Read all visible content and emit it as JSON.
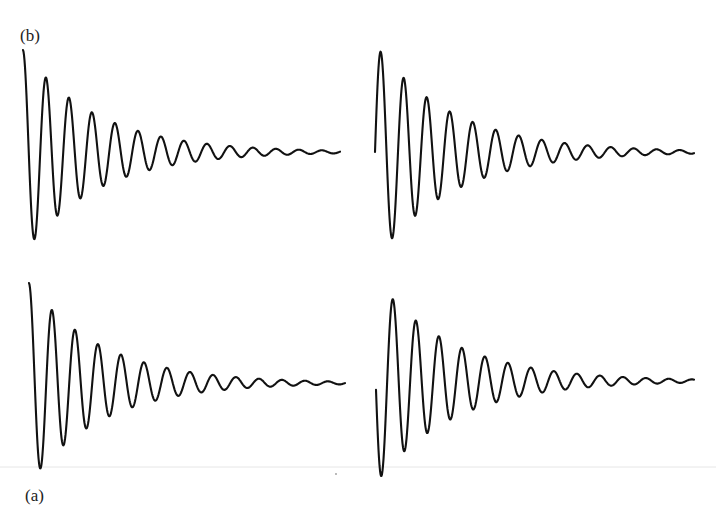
{
  "figure": {
    "labels": [
      {
        "id": "b",
        "text": "(b)",
        "x": 20,
        "y": 27
      },
      {
        "id": "a",
        "text": "(a)",
        "x": 25,
        "y": 487
      }
    ]
  },
  "chart_data": {
    "type": "line",
    "title": "",
    "grid": false,
    "axes_visible": false,
    "legend": null,
    "model": "y_px = baseline - amplitude * exp(-decay * t) * cos(2*pi*t/period + phase), t = x - x_start",
    "panels": [
      {
        "name": "top-left",
        "row_label": "(b)",
        "x_start": 23,
        "x_end": 340,
        "baseline_y": 152,
        "amplitude": 102,
        "period": 23,
        "decay_per_period": 0.73,
        "phase_deg": 0,
        "start_point": [
          23,
          50
        ],
        "extrema": [
          [
            23,
            50
          ],
          [
            35,
            245
          ],
          [
            45,
            71
          ],
          [
            57,
            220
          ],
          [
            68,
            93
          ],
          [
            80,
            203
          ],
          [
            91,
            108
          ],
          [
            103,
            190
          ],
          [
            114,
            120
          ],
          [
            137,
            129
          ],
          [
            159,
            136
          ],
          [
            182,
            141
          ],
          [
            205,
            144
          ],
          [
            227,
            147
          ]
        ],
        "flat_tail_from_x": 290
      },
      {
        "name": "top-right",
        "row_label": "(b)",
        "x_start": 375,
        "x_end": 694,
        "baseline_y": 152,
        "amplitude": 108,
        "period": 23,
        "decay_per_period": 0.74,
        "phase_deg": 270,
        "start_point": [
          375,
          152
        ],
        "extrema": [
          [
            380,
            51
          ],
          [
            393,
            240
          ],
          [
            404,
            76
          ],
          [
            415,
            218
          ],
          [
            426,
            97
          ],
          [
            438,
            200
          ],
          [
            450,
            111
          ]
        ],
        "flat_tail_from_x": 645
      },
      {
        "name": "bottom-left",
        "row_label": "(a)",
        "x_start": 29,
        "x_end": 345,
        "baseline_y": 383,
        "amplitude": 100,
        "period": 23,
        "decay_per_period": 0.73,
        "phase_deg": 0,
        "start_point": [
          29,
          285
        ],
        "extrema": [
          [
            29,
            285
          ],
          [
            40,
            476
          ],
          [
            50,
            303
          ],
          [
            62,
            452
          ],
          [
            72,
            325
          ],
          [
            85,
            435
          ],
          [
            95,
            341
          ],
          [
            107,
            421
          ]
        ],
        "flat_tail_from_x": 300
      },
      {
        "name": "bottom-right",
        "row_label": "(a)",
        "x_start": 376,
        "x_end": 694,
        "baseline_y": 381,
        "amplitude": 102,
        "period": 23,
        "decay_per_period": 0.74,
        "phase_deg": 95,
        "start_point": [
          376,
          376
        ],
        "extrema": [
          [
            382,
            476
          ],
          [
            392,
            296
          ],
          [
            404,
            458
          ],
          [
            414,
            319
          ],
          [
            427,
            439
          ],
          [
            438,
            337
          ],
          [
            450,
            423
          ]
        ],
        "flat_tail_from_x": 645
      }
    ]
  },
  "style": {
    "trace_color": "#111111",
    "background": "#ffffff"
  }
}
